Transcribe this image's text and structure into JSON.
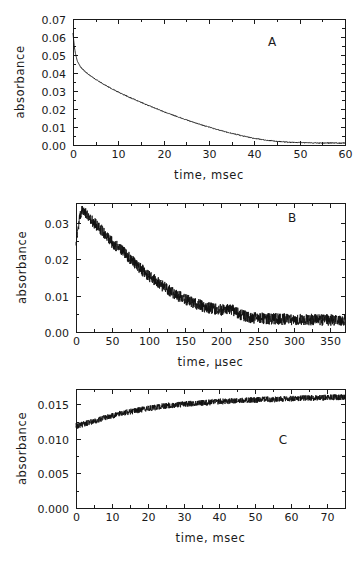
{
  "figure": {
    "background": "#ffffff",
    "ink": "#1a1a1a",
    "panel_count": 3
  },
  "chart_data": [
    {
      "type": "line",
      "panel_label": "A",
      "title": "",
      "xlabel": "time, msec",
      "ylabel": "absorbance",
      "xlim": [
        0,
        60
      ],
      "ylim": [
        0,
        0.07
      ],
      "xticks": [
        0,
        10,
        20,
        30,
        40,
        50,
        60
      ],
      "xticklabels": [
        "0",
        "10",
        "20",
        "30",
        "40",
        "50",
        "60"
      ],
      "yticks": [
        0.0,
        0.01,
        0.02,
        0.03,
        0.04,
        0.05,
        0.06,
        0.07
      ],
      "yticklabels": [
        "0.00",
        "0.01",
        "0.02",
        "0.03",
        "0.04",
        "0.05",
        "0.06",
        "0.07"
      ],
      "minor_xticks": [
        5,
        15,
        25,
        35,
        45,
        55
      ],
      "minor_yticks": [
        0.005,
        0.015,
        0.025,
        0.035,
        0.045,
        0.055,
        0.065
      ],
      "grid": false,
      "legend": false,
      "noise_amplitude": 0.00025,
      "description": "Biexponential absorbance decay from 0.062 to baseline ~0.001 over 60 msec",
      "x": [
        0,
        0.3,
        0.6,
        1,
        1.5,
        2,
        2.5,
        3,
        4,
        5,
        6,
        7,
        8,
        9,
        10,
        11,
        12,
        13,
        14,
        15,
        16,
        17,
        18,
        19,
        20,
        21,
        22,
        23,
        24,
        25,
        26,
        27,
        28,
        29,
        30,
        31,
        32,
        33,
        34,
        35,
        36,
        37,
        38,
        39,
        40,
        42,
        44,
        46,
        48,
        50,
        52,
        54,
        56,
        58,
        60
      ],
      "y": [
        0.062,
        0.0545,
        0.05,
        0.0464,
        0.044,
        0.0424,
        0.0412,
        0.0401,
        0.0382,
        0.0365,
        0.0349,
        0.0334,
        0.032,
        0.0307,
        0.0294,
        0.0282,
        0.027,
        0.0259,
        0.0248,
        0.0237,
        0.0226,
        0.0216,
        0.0206,
        0.0196,
        0.0186,
        0.0176,
        0.0167,
        0.0158,
        0.0149,
        0.014,
        0.0131,
        0.0123,
        0.0115,
        0.0107,
        0.01,
        0.0092,
        0.0085,
        0.0078,
        0.0071,
        0.0065,
        0.0059,
        0.0053,
        0.0047,
        0.0042,
        0.0037,
        0.0029,
        0.0023,
        0.0018,
        0.0015,
        0.0013,
        0.0012,
        0.0011,
        0.0011,
        0.0011,
        0.0011
      ]
    },
    {
      "type": "line",
      "panel_label": "B",
      "title": "",
      "xlabel": "time, μsec",
      "ylabel": "absorbance",
      "xlim": [
        0,
        370
      ],
      "ylim": [
        0,
        0.0355
      ],
      "xticks": [
        0,
        50,
        100,
        150,
        200,
        250,
        300,
        350
      ],
      "xticklabels": [
        "0",
        "50",
        "100",
        "150",
        "200",
        "250",
        "300",
        "350"
      ],
      "yticks": [
        0.0,
        0.01,
        0.02,
        0.03
      ],
      "yticklabels": [
        "0.00",
        "0.01",
        "0.02",
        "0.03"
      ],
      "minor_xticks": [
        25,
        75,
        125,
        175,
        225,
        275,
        325
      ],
      "minor_yticks": [
        0.005,
        0.015,
        0.025
      ],
      "grid": false,
      "legend": false,
      "noise_amplitude": 0.0016,
      "description": "Noisy rise to peak 0.034 at ~10 usec then decay to ~0.003 baseline by 250 usec",
      "x": [
        0,
        3,
        6,
        9,
        12,
        15,
        20,
        25,
        30,
        35,
        40,
        45,
        50,
        55,
        60,
        65,
        70,
        75,
        80,
        85,
        90,
        95,
        100,
        105,
        110,
        115,
        120,
        125,
        130,
        135,
        140,
        145,
        150,
        155,
        160,
        165,
        170,
        175,
        180,
        185,
        190,
        195,
        200,
        205,
        210,
        215,
        220,
        225,
        230,
        240,
        250,
        260,
        270,
        280,
        290,
        300,
        310,
        320,
        330,
        340,
        350,
        360,
        370
      ],
      "y": [
        0.025,
        0.0292,
        0.0322,
        0.0338,
        0.0332,
        0.0325,
        0.0312,
        0.03,
        0.0292,
        0.028,
        0.0268,
        0.0256,
        0.0246,
        0.0238,
        0.023,
        0.0224,
        0.0212,
        0.02,
        0.019,
        0.0182,
        0.0172,
        0.0164,
        0.0155,
        0.0148,
        0.014,
        0.0133,
        0.0126,
        0.0119,
        0.0112,
        0.0105,
        0.01,
        0.0095,
        0.009,
        0.0086,
        0.0082,
        0.0078,
        0.0074,
        0.0071,
        0.0068,
        0.0065,
        0.0063,
        0.0062,
        0.0061,
        0.0061,
        0.0062,
        0.006,
        0.0056,
        0.005,
        0.0045,
        0.004,
        0.0038,
        0.0037,
        0.0036,
        0.0036,
        0.0035,
        0.0035,
        0.0034,
        0.0034,
        0.0034,
        0.0033,
        0.0033,
        0.0033,
        0.0033
      ]
    },
    {
      "type": "line",
      "panel_label": "C",
      "title": "",
      "xlabel": "time, msec",
      "ylabel": "absorbance",
      "xlim": [
        0,
        75
      ],
      "ylim": [
        0,
        0.0172
      ],
      "xticks": [
        0,
        10,
        20,
        30,
        40,
        50,
        60,
        70
      ],
      "xticklabels": [
        "0",
        "10",
        "20",
        "30",
        "40",
        "50",
        "60",
        "70"
      ],
      "yticks": [
        0.0,
        0.005,
        0.01,
        0.015
      ],
      "yticklabels": [
        "0.000",
        "0.005",
        "0.010",
        "0.015"
      ],
      "minor_xticks": [
        5,
        15,
        25,
        35,
        45,
        55,
        65
      ],
      "minor_yticks": [
        0.0025,
        0.0075,
        0.0125
      ],
      "grid": false,
      "legend": false,
      "noise_amplitude": 0.00042,
      "description": "Noisy exponential rise from 0.0118 toward plateau near 0.0160 over 75 msec",
      "x": [
        0,
        2,
        4,
        6,
        8,
        10,
        12,
        14,
        16,
        18,
        20,
        22,
        24,
        26,
        28,
        30,
        32,
        34,
        36,
        38,
        40,
        42,
        44,
        46,
        48,
        50,
        52,
        54,
        56,
        58,
        60,
        62,
        64,
        66,
        68,
        70,
        72,
        74,
        75
      ],
      "y": [
        0.0118,
        0.0121,
        0.0124,
        0.0127,
        0.013,
        0.0133,
        0.0136,
        0.0138,
        0.014,
        0.0142,
        0.0144,
        0.0145,
        0.0147,
        0.0148,
        0.0149,
        0.015,
        0.0151,
        0.0152,
        0.0152,
        0.0153,
        0.0154,
        0.0154,
        0.0155,
        0.0155,
        0.0156,
        0.0156,
        0.0157,
        0.0157,
        0.0157,
        0.0158,
        0.0158,
        0.0158,
        0.0159,
        0.0159,
        0.0159,
        0.016,
        0.016,
        0.016,
        0.016
      ]
    }
  ]
}
